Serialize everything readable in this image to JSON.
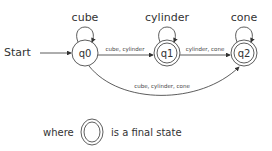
{
  "diagram": {
    "type": "finite-state-automaton",
    "start_label": "Start",
    "states": [
      {
        "id": "q0",
        "label": "q0",
        "final": false,
        "self_loop_label": "cube"
      },
      {
        "id": "q1",
        "label": "q1",
        "final": true,
        "self_loop_label": "cylinder"
      },
      {
        "id": "q2",
        "label": "q2",
        "final": true,
        "self_loop_label": "cone"
      }
    ],
    "transitions": [
      {
        "from": "q0",
        "to": "q1",
        "label": "cube, cylinder"
      },
      {
        "from": "q1",
        "to": "q2",
        "label": "cylinder, cone"
      },
      {
        "from": "q0",
        "to": "q2",
        "label": "cube, cylinder, cone"
      }
    ],
    "legend": {
      "prefix": "where",
      "suffix": "is a final state"
    }
  }
}
